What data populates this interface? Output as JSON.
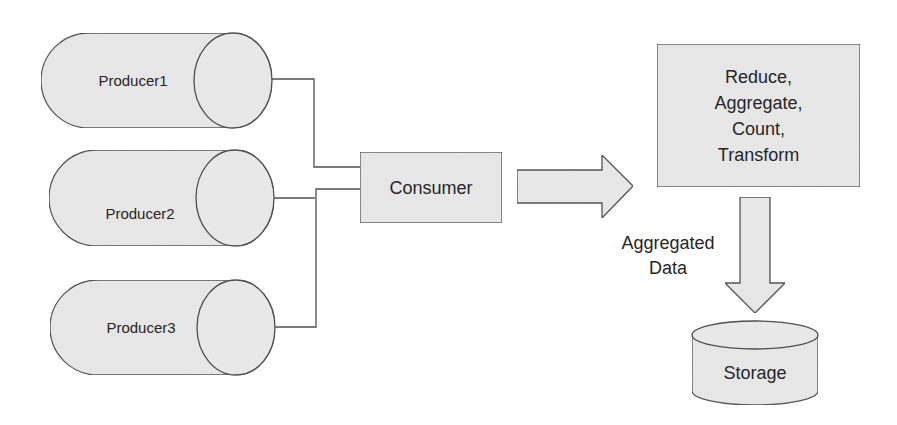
{
  "diagram": {
    "colors": {
      "fill": "#e8e8e8",
      "stroke": "#4f4f4f",
      "text": "#262626",
      "background": "#ffffff"
    },
    "producers": [
      {
        "label": "Producer1"
      },
      {
        "label": "Producer2"
      },
      {
        "label": "Producer3"
      }
    ],
    "consumer": {
      "label": "Consumer"
    },
    "process": {
      "lines": [
        "Reduce,",
        "Aggregate,",
        "Count,",
        "Transform"
      ]
    },
    "edge_label": {
      "lines": [
        "Aggregated",
        "Data"
      ]
    },
    "storage": {
      "label": "Storage"
    }
  }
}
